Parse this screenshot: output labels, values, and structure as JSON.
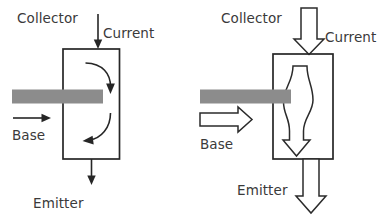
{
  "figure": {
    "background_color": "#ffffff",
    "line_color": "#262626",
    "text_color": "#3a3a3a",
    "base_bar_color": "#8c8c8c",
    "width": 389,
    "height": 220
  },
  "panels": [
    {
      "id": "left",
      "name": "curved-arrow-transistor",
      "labels": {
        "collector": "Collector",
        "current": "Current",
        "base": "Base",
        "emitter": "Emitter"
      },
      "arrow_style": "thin-solid",
      "internal_flow": "two-curved-arrows"
    },
    {
      "id": "right",
      "name": "outline-arrow-transistor",
      "labels": {
        "collector": "Collector",
        "current": "Current",
        "base": "Base",
        "emitter": "Emitter"
      },
      "arrow_style": "wide-outline",
      "internal_flow": "single-wavy-outline-arrow"
    }
  ]
}
